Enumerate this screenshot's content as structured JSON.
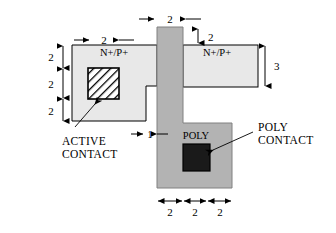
{
  "figure": {
    "colors": {
      "active_fill": "#e8e8e8",
      "poly_fill": "#b3b3b3",
      "active_contact_fill": "#ffffff",
      "poly_contact_fill": "#1a1a1a",
      "outline": "#000000",
      "background": "#ffffff"
    }
  },
  "regions": {
    "active_left_label": "N+/P+",
    "active_right_label": "N+/P+",
    "poly_label": "POLY"
  },
  "callouts": [
    {
      "id": "active-contact",
      "line1": "ACTIVE",
      "line2": "CONTACT"
    },
    {
      "id": "poly-contact",
      "line1": "POLY",
      "line2": "CONTACT"
    }
  ],
  "dimensions": {
    "top_poly_width": "2",
    "active_left_inset": "2",
    "right_gap_above_active": "2",
    "right_active_height": "3",
    "left_stack": [
      "2",
      "2",
      "2"
    ],
    "notch_width": "1",
    "bottom_segments": [
      "2",
      "2",
      "2"
    ]
  }
}
